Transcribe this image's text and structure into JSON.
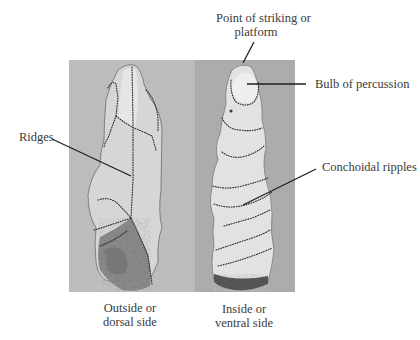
{
  "figure": {
    "type": "annotated-photo-diagram",
    "colors": {
      "background": "#ffffff",
      "photo_left_bg": "#b9b9b9",
      "photo_right_bg": "#a9a9a9",
      "flake_fill": "#d8d8d8",
      "ventral_fill": "#e2e2e2",
      "cortex_fill": "#8a8a8a",
      "dotted_line": "#2e2e2e",
      "leader_line": "#222222",
      "label_text": "#3b3b3b"
    },
    "annotations": {
      "platform": {
        "line1": "Point of striking or",
        "line2": "platform"
      },
      "bulb": {
        "text": "Bulb of percussion"
      },
      "ridges": {
        "text": "Ridges"
      },
      "ripples": {
        "text": "Conchoidal ripples"
      }
    },
    "captions": {
      "dorsal": {
        "line1": "Outside or",
        "line2": "dorsal side"
      },
      "ventral": {
        "line1": "Inside or",
        "line2": "ventral side"
      }
    }
  }
}
